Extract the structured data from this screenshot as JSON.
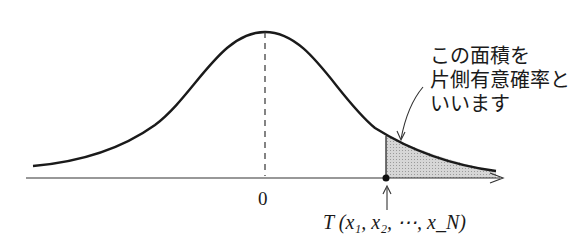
{
  "diagram": {
    "type": "normal-distribution-one-tailed",
    "annotation": {
      "lines": [
        "この面積を",
        "片側有意確率と",
        "いいます"
      ]
    },
    "axis": {
      "center_label": "0",
      "statistic_label": "T (x₁, x₂, ⋯, x_N)"
    },
    "colors": {
      "curve": "#1a1a1a",
      "shade": "#c8c8c8",
      "background": "#ffffff"
    }
  }
}
